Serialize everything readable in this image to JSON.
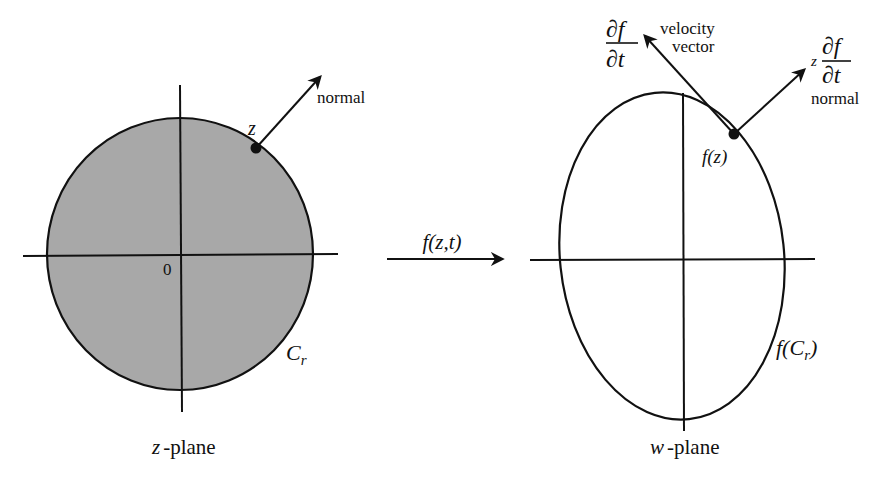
{
  "colors": {
    "ink": "#111111",
    "disk_fill": "#a8a8a8",
    "background": "#ffffff"
  },
  "left_panel": {
    "plane_label_var": "z",
    "plane_label_suffix": "-plane",
    "origin_label": "0",
    "point_label": "z",
    "normal_label": "normal",
    "curve_label_main": "C",
    "curve_label_sub": "r"
  },
  "mapping": {
    "label": "f(z,t)"
  },
  "right_panel": {
    "plane_label_var": "w",
    "plane_label_suffix": "-plane",
    "point_label": "f(z)",
    "velocity_num": "∂f",
    "velocity_den": "∂t",
    "velocity_text_line1": "velocity",
    "velocity_text_line2": "vector",
    "normal_prefix": "z",
    "normal_num": "∂f",
    "normal_den": "∂t",
    "normal_label": "normal",
    "curve_label_prefix": "f(",
    "curve_label_main": "C",
    "curve_label_sub": "r",
    "curve_label_suffix": ")"
  }
}
